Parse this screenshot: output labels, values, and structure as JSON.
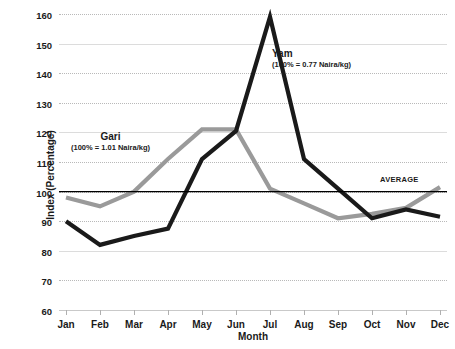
{
  "chart_data": {
    "type": "line",
    "title": "",
    "xlabel": "Month",
    "ylabel": "Index (Percentage)",
    "categories": [
      "Jan",
      "Feb",
      "Mar",
      "Apr",
      "May",
      "Jun",
      "Jul",
      "Aug",
      "Sep",
      "Oct",
      "Nov",
      "Dec"
    ],
    "ylim": [
      60,
      160
    ],
    "ytick_step": 10,
    "yticks": [
      60,
      70,
      80,
      90,
      100,
      110,
      120,
      130,
      140,
      150,
      160
    ],
    "grid": true,
    "legend_position": "inline-annotations",
    "series": [
      {
        "name": "Yam",
        "annotation": "(100% = 0.77 Naira/kg)",
        "color": "#1a1a1a",
        "values": [
          90,
          82,
          85,
          87.5,
          111,
          120.5,
          159,
          111,
          101,
          91,
          94,
          91.5
        ]
      },
      {
        "name": "Gari",
        "annotation": "(100% = 1.01 Naira/kg)",
        "color": "#9a9a9a",
        "values": [
          98,
          95,
          100,
          111,
          121,
          121,
          101,
          96,
          91,
          92.5,
          94.5,
          101.5
        ]
      }
    ],
    "reference_line": {
      "label": "AVERAGE",
      "value": 100,
      "color": "#000000"
    },
    "annotations": [
      {
        "text": "Gari",
        "sub": "(100% = 1.01 Naira/kg)"
      },
      {
        "text": "Yam",
        "sub": "(100% = 0.77 Naira/kg)"
      },
      {
        "text": "AVERAGE",
        "sub": ""
      }
    ]
  }
}
